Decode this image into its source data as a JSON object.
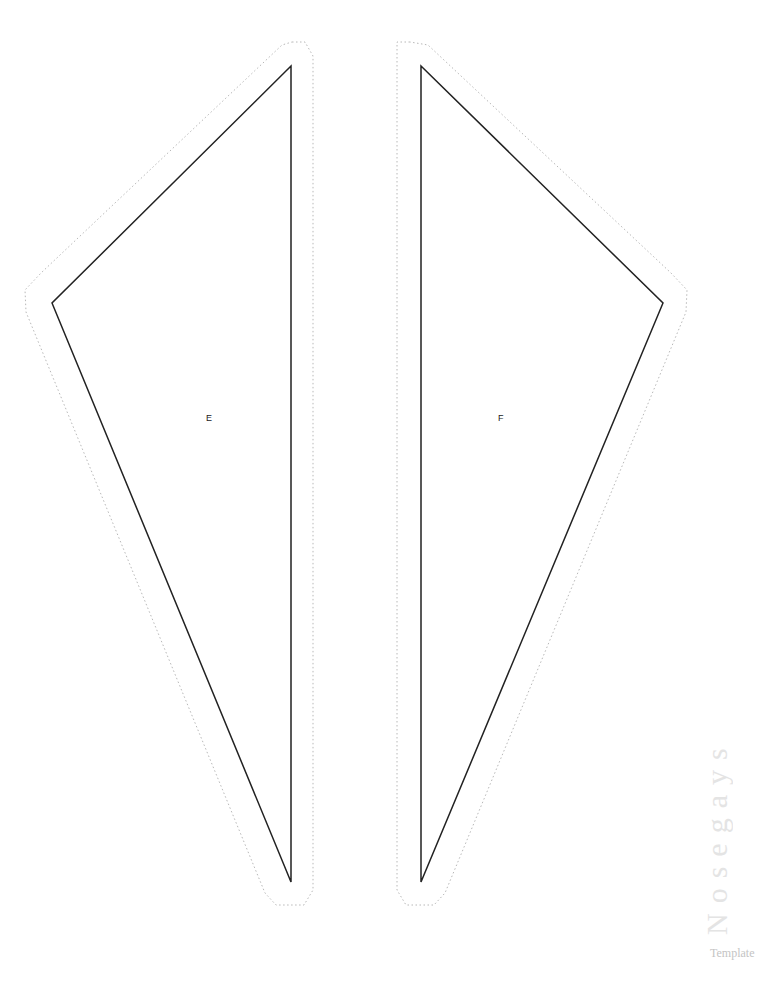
{
  "template": {
    "title": "Nosegays",
    "subtitle": "Template"
  },
  "pieces": [
    {
      "label": "E",
      "name": "piece-e"
    },
    {
      "label": "F",
      "name": "piece-f"
    }
  ],
  "colors": {
    "cut_line": "#222222",
    "fold_line": "#b8b8b8",
    "watermark": "#e4e4e4",
    "subtitle": "#c4c4c4"
  }
}
